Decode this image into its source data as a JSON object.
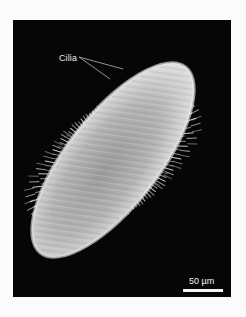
{
  "figure": {
    "type": "scanning electron micrograph",
    "background_color": "#060606",
    "page_color": "#fbfbfb",
    "organism_color": "#c9c9c9",
    "label": {
      "text": "Cilia",
      "pointer_lines": 2
    },
    "scale_bar": {
      "text": "50 µm",
      "color": "#f4f4f4"
    }
  }
}
